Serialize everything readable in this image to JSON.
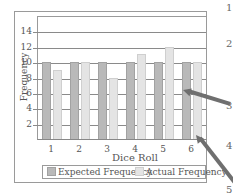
{
  "chart_data": {
    "type": "bar",
    "title": "",
    "xlabel": "Dice Roll",
    "ylabel": "Frequency",
    "categories": [
      "1",
      "2",
      "3",
      "4",
      "5",
      "6"
    ],
    "series": [
      {
        "name": "Expected Frequency",
        "values": [
          10,
          10,
          10,
          10,
          10,
          10
        ],
        "color": "#b9b9b9"
      },
      {
        "name": "Actual Frequency",
        "values": [
          9,
          10,
          8,
          11,
          12,
          10
        ],
        "color": "#e4e4e4"
      }
    ],
    "ylim": [
      0,
      16
    ],
    "yticks": [
      2,
      4,
      6,
      8,
      10,
      12,
      14
    ],
    "grid": true,
    "legend_position": "bottom"
  },
  "margin_numbers": [
    "1",
    "2",
    "3",
    "4",
    "5"
  ],
  "annotations": {
    "arrows": 2,
    "arrow_color": "#6f6f6f"
  }
}
